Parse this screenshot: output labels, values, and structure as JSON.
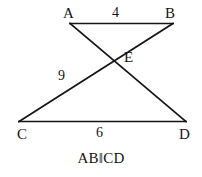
{
  "figure": {
    "type": "geometry-diagram",
    "background_color": "#ffffff",
    "stroke_color": "#151515",
    "text_color": "#141414",
    "canvas": {
      "width": 202,
      "height": 177
    },
    "points": {
      "A": {
        "label": "A",
        "x": 70,
        "y": 23,
        "label_x": 63,
        "label_y": 6
      },
      "B": {
        "label": "B",
        "x": 173,
        "y": 23,
        "label_x": 165,
        "label_y": 6
      },
      "C": {
        "label": "C",
        "x": 19,
        "y": 122,
        "label_x": 17,
        "label_y": 127
      },
      "D": {
        "label": "D",
        "x": 186,
        "y": 122,
        "label_x": 179,
        "label_y": 127
      },
      "E": {
        "label": "E",
        "x": 112,
        "y": 58,
        "label_x": 124,
        "label_y": 50
      }
    },
    "segments": [
      {
        "name": "AB",
        "from": "A",
        "to": "B"
      },
      {
        "name": "AD",
        "from": "A",
        "to": "D"
      },
      {
        "name": "BC",
        "from": "B",
        "to": "C"
      },
      {
        "name": "CD",
        "from": "C",
        "to": "D"
      }
    ],
    "measures": {
      "AB": {
        "value": "4",
        "x": 112,
        "y": 6
      },
      "CE": {
        "value": "9",
        "x": 58,
        "y": 69
      },
      "CD": {
        "value": "6",
        "x": 96,
        "y": 126
      }
    },
    "caption": "AB‖CD"
  }
}
